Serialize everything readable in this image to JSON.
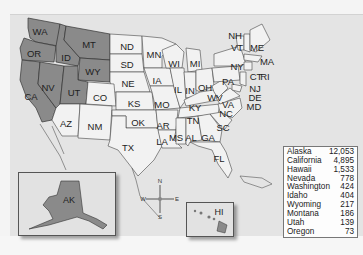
{
  "map": {
    "highlight_color": "#8a8a8a",
    "base_color": "#f2f2f2",
    "state_labels": {
      "WA": "WA",
      "OR": "OR",
      "CA": "CA",
      "ID": "ID",
      "NV": "NV",
      "MT": "MT",
      "WY": "WY",
      "UT": "UT",
      "ND": "ND",
      "SD": "SD",
      "NE": "NE",
      "CO": "CO",
      "KS": "KS",
      "AZ": "AZ",
      "NM": "NM",
      "OK": "OK",
      "TX": "TX",
      "MN": "MN",
      "IA": "IA",
      "MO": "MO",
      "AR": "AR",
      "LA": "LA",
      "WI": "WI",
      "IL": "IL",
      "MI": "MI",
      "IN": "IN",
      "OH": "OH",
      "KY": "KY",
      "TN": "TN",
      "MS": "MS",
      "AL": "AL",
      "GA": "GA",
      "FL": "FL",
      "SC": "SC",
      "NC": "NC",
      "VA": "VA",
      "WV": "WV",
      "PA": "PA",
      "NY": "NY",
      "VT": "VT",
      "NH": "NH",
      "ME": "ME",
      "MA": "MA",
      "RI": "RI",
      "CT": "CT",
      "NJ": "NJ",
      "DE": "DE",
      "MD": "MD",
      "AK": "AK",
      "HI": "HI"
    },
    "highlighted_states": [
      "WA",
      "OR",
      "CA",
      "ID",
      "NV",
      "MT",
      "WY",
      "UT",
      "AK",
      "HI"
    ],
    "compass": {
      "n": "N",
      "s": "S",
      "e": "E",
      "w": "W"
    }
  },
  "legend": {
    "rows": [
      {
        "state": "Alaska",
        "value": "12,053"
      },
      {
        "state": "California",
        "value": "4,895"
      },
      {
        "state": "Hawaii",
        "value": "1,533"
      },
      {
        "state": "Nevada",
        "value": "778"
      },
      {
        "state": "Washington",
        "value": "424"
      },
      {
        "state": "Idaho",
        "value": "404"
      },
      {
        "state": "Wyoming",
        "value": "217"
      },
      {
        "state": "Montana",
        "value": "186"
      },
      {
        "state": "Utah",
        "value": "139"
      },
      {
        "state": "Oregon",
        "value": "73"
      }
    ]
  }
}
